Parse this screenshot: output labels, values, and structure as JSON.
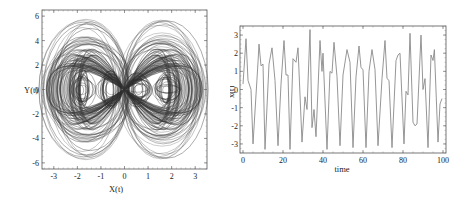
{
  "figure": {
    "left_panel": {
      "xlabel": "X(t)",
      "ylabel": "Y(t)",
      "xticks": [
        "-3",
        "-2",
        "-1",
        "0",
        "1",
        "2",
        "3"
      ],
      "yticks": [
        "-6",
        "-4",
        "-2",
        "0",
        "2",
        "4",
        "6"
      ]
    },
    "right_panel": {
      "xlabel": "time",
      "ylabel": "x(t)",
      "xticks": [
        "0",
        "20",
        "40",
        "60",
        "80",
        "100"
      ],
      "yticks": [
        "-3",
        "-2",
        "-1",
        "0",
        "1",
        "2",
        "3"
      ]
    }
  },
  "chart_data": [
    {
      "type": "line",
      "title": "",
      "subtitle": "Phase portrait (double-scroll chaotic attractor, four inner scroll centers)",
      "xlabel": "X(t)",
      "ylabel": "Y(t)",
      "xlim": [
        -3.5,
        3.5
      ],
      "ylim": [
        -6.5,
        6.5
      ],
      "xticks": [
        -3,
        -2,
        -1,
        0,
        1,
        2,
        3
      ],
      "yticks": [
        -6,
        -4,
        -2,
        0,
        2,
        4,
        6
      ],
      "grid": false,
      "legend": null,
      "line_color": "#3a3a3a",
      "scroll_centers": [
        {
          "x": -1.8,
          "y": 0
        },
        {
          "x": -0.6,
          "y": 0
        },
        {
          "x": 0.6,
          "y": 0
        },
        {
          "x": 1.8,
          "y": 0
        }
      ],
      "outer_envelope": {
        "x_extent": [
          -3.3,
          3.3
        ],
        "y_extent": [
          -6.1,
          6.1
        ],
        "shape": "figure-eight / butterfly lobes crossing near origin"
      },
      "inner_loops": {
        "rx_range": [
          0.15,
          0.6
        ],
        "ry_range": [
          0.3,
          1.6
        ]
      }
    },
    {
      "type": "line",
      "title": "",
      "xlabel": "time",
      "ylabel": "x(t)",
      "xlim": [
        -1.5,
        101.5
      ],
      "ylim": [
        -3.5,
        3.5
      ],
      "xticks": [
        0,
        20,
        40,
        60,
        80,
        100
      ],
      "yticks": [
        -3,
        -2,
        -1,
        0,
        1,
        2,
        3
      ],
      "grid": false,
      "legend": null,
      "line_color": "#8a8a8a",
      "series": [
        {
          "name": "x(t)",
          "x": [
            0,
            1.5,
            2.5,
            4,
            5,
            7.5,
            8,
            9,
            10,
            11,
            13,
            14.5,
            16,
            17.5,
            19,
            20.5,
            21.5,
            22.5,
            23.5,
            25,
            26.5,
            27.5,
            29.5,
            31,
            32,
            33.5,
            34.5,
            35.5,
            36.5,
            38.5,
            39.5,
            40,
            42,
            43.5,
            44.5,
            45.5,
            47,
            48.5,
            50,
            52,
            53.5,
            55,
            56.5,
            58,
            59,
            60,
            61.5,
            63,
            64.5,
            66,
            67.5,
            69.5,
            71,
            72,
            73,
            74.5,
            76.5,
            77.5,
            78.5,
            80.5,
            81.5,
            82.5,
            83.5,
            85,
            86,
            87,
            89,
            90,
            91,
            92.5,
            94,
            95,
            95.7,
            97.5,
            98.5,
            99.5
          ],
          "y": [
            0.3,
            2.8,
            0.5,
            0,
            -3,
            1.5,
            2.5,
            1.3,
            1.4,
            -3.3,
            1.4,
            2.3,
            0.5,
            -3.1,
            0.3,
            2.7,
            0.8,
            0.8,
            -3.3,
            1.7,
            1.5,
            2.3,
            -2.9,
            -0.4,
            -1.1,
            3.3,
            -2.1,
            -1.1,
            -2.6,
            2.7,
            1.0,
            2.0,
            -3.3,
            1.0,
            0.9,
            2.6,
            0.7,
            -3.1,
            0.8,
            2.2,
            1.5,
            -3.2,
            0.7,
            2.4,
            1.2,
            1.1,
            -3.2,
            1.0,
            2.2,
            1.1,
            -3.1,
            0.6,
            2.7,
            0.6,
            0.5,
            -3.2,
            1.6,
            1.9,
            2.0,
            -3.0,
            -0.1,
            -0.3,
            3.1,
            -1.8,
            -2.0,
            -1.9,
            3.0,
            0.0,
            0.6,
            -3.2,
            1.9,
            1.6,
            2.2,
            -2.9,
            -0.8,
            -0.5
          ]
        }
      ]
    }
  ]
}
